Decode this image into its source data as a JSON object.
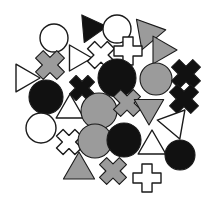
{
  "canvas": {
    "width": 207,
    "height": 199,
    "background": "#ffffff",
    "title": "shape-cluster-image"
  },
  "palette": {
    "black": "#111111",
    "gray": "#9b9b9b",
    "white": "#ffffff",
    "outline": "#1a1a1a",
    "background": "#ffffff"
  },
  "counts": {
    "total": 33,
    "circles": 11,
    "triangles": 11,
    "crosses": 11,
    "black": 11,
    "gray": 11,
    "white": 11
  },
  "shapes": [
    {
      "id": 1,
      "kind": "circle",
      "fill": "white",
      "cx": 54,
      "cy": 38,
      "r": 14,
      "rotation": 0,
      "label": "white-circle-top-left"
    },
    {
      "id": 2,
      "kind": "triangle",
      "fill": "black",
      "cx": 91,
      "cy": 28,
      "r": 16,
      "rotation": 205,
      "label": "black-triangle-top"
    },
    {
      "id": 3,
      "kind": "circle",
      "fill": "white",
      "cx": 117,
      "cy": 29,
      "r": 14,
      "rotation": 0,
      "label": "white-circle-top-center"
    },
    {
      "id": 4,
      "kind": "triangle",
      "fill": "gray",
      "cx": 148,
      "cy": 33,
      "r": 18,
      "rotation": 200,
      "label": "gray-triangle-top-right"
    },
    {
      "id": 5,
      "kind": "triangle",
      "fill": "gray",
      "cx": 161,
      "cy": 50,
      "r": 16,
      "rotation": 90,
      "label": "gray-triangle-upper-right"
    },
    {
      "id": 6,
      "kind": "cross-x",
      "fill": "gray",
      "cx": 50,
      "cy": 65,
      "r": 15,
      "rotation": 45,
      "label": "gray-x-left"
    },
    {
      "id": 7,
      "kind": "triangle",
      "fill": "white",
      "cx": 77,
      "cy": 58,
      "r": 15,
      "rotation": 90,
      "label": "white-triangle-upper-center"
    },
    {
      "id": 8,
      "kind": "cross-x",
      "fill": "white",
      "cx": 101,
      "cy": 55,
      "r": 14,
      "rotation": 45,
      "label": "white-x-top-center"
    },
    {
      "id": 9,
      "kind": "cross-x",
      "fill": "white",
      "cx": 128,
      "cy": 51,
      "r": 14,
      "rotation": 0,
      "label": "white-plus-top-center"
    },
    {
      "id": 10,
      "kind": "triangle",
      "fill": "white",
      "cx": 24,
      "cy": 78,
      "r": 16,
      "rotation": 90,
      "label": "white-triangle-left-edge"
    },
    {
      "id": 11,
      "kind": "circle",
      "fill": "black",
      "cx": 117,
      "cy": 78,
      "r": 19,
      "rotation": 0,
      "label": "black-circle-center-top"
    },
    {
      "id": 12,
      "kind": "circle",
      "fill": "gray",
      "cx": 156,
      "cy": 79,
      "r": 16,
      "rotation": 0,
      "label": "gray-circle-right"
    },
    {
      "id": 13,
      "kind": "cross-x",
      "fill": "black",
      "cx": 186,
      "cy": 74,
      "r": 15,
      "rotation": 45,
      "label": "black-x-right-upper"
    },
    {
      "id": 14,
      "kind": "cross-x",
      "fill": "black",
      "cx": 82,
      "cy": 88,
      "r": 13,
      "rotation": 45,
      "label": "black-x-center-left"
    },
    {
      "id": 15,
      "kind": "circle",
      "fill": "black",
      "cx": 46,
      "cy": 97,
      "r": 17,
      "rotation": 0,
      "label": "black-circle-left"
    },
    {
      "id": 16,
      "kind": "cross-x",
      "fill": "black",
      "cx": 184,
      "cy": 99,
      "r": 15,
      "rotation": 45,
      "label": "black-x-right-lower"
    },
    {
      "id": 17,
      "kind": "triangle",
      "fill": "white",
      "cx": 70,
      "cy": 110,
      "r": 16,
      "rotation": 0,
      "label": "white-triangle-center"
    },
    {
      "id": 18,
      "kind": "circle",
      "fill": "gray",
      "cx": 99,
      "cy": 111,
      "r": 18,
      "rotation": 0,
      "label": "gray-circle-center"
    },
    {
      "id": 19,
      "kind": "cross-x",
      "fill": "gray",
      "cx": 127,
      "cy": 103,
      "r": 14,
      "rotation": 45,
      "label": "gray-x-center-right"
    },
    {
      "id": 20,
      "kind": "triangle",
      "fill": "gray",
      "cx": 149,
      "cy": 108,
      "r": 17,
      "rotation": 180,
      "label": "gray-triangle-center-right"
    },
    {
      "id": 21,
      "kind": "circle",
      "fill": "white",
      "cx": 41,
      "cy": 128,
      "r": 15,
      "rotation": 0,
      "label": "white-circle-lower-left"
    },
    {
      "id": 22,
      "kind": "triangle",
      "fill": "white",
      "cx": 174,
      "cy": 123,
      "r": 17,
      "rotation": 160,
      "label": "white-triangle-right-lower"
    },
    {
      "id": 23,
      "kind": "cross-x",
      "fill": "white",
      "cx": 69,
      "cy": 142,
      "r": 13,
      "rotation": 45,
      "label": "white-x-lower-left"
    },
    {
      "id": 24,
      "kind": "circle",
      "fill": "gray",
      "cx": 95,
      "cy": 141,
      "r": 17,
      "rotation": 0,
      "label": "gray-circle-lower-center"
    },
    {
      "id": 25,
      "kind": "circle",
      "fill": "black",
      "cx": 124,
      "cy": 140,
      "r": 17,
      "rotation": 0,
      "label": "black-circle-lower-center"
    },
    {
      "id": 26,
      "kind": "triangle",
      "fill": "white",
      "cx": 152,
      "cy": 146,
      "r": 16,
      "rotation": 0,
      "label": "white-triangle-lower-right"
    },
    {
      "id": 27,
      "kind": "circle",
      "fill": "black",
      "cx": 180,
      "cy": 155,
      "r": 15,
      "rotation": 0,
      "label": "black-circle-bottom-right"
    },
    {
      "id": 28,
      "kind": "triangle",
      "fill": "gray",
      "cx": 79,
      "cy": 170,
      "r": 18,
      "rotation": 0,
      "label": "gray-triangle-bottom"
    },
    {
      "id": 29,
      "kind": "cross-x",
      "fill": "gray",
      "cx": 113,
      "cy": 171,
      "r": 14,
      "rotation": 45,
      "label": "gray-x-bottom"
    },
    {
      "id": 30,
      "kind": "cross-x",
      "fill": "white",
      "cx": 147,
      "cy": 178,
      "r": 14,
      "rotation": 0,
      "label": "white-plus-bottom"
    },
    {
      "id": 31,
      "kind": "circle",
      "fill": "white",
      "cx": 54,
      "cy": 38,
      "r": 0,
      "rotation": 0,
      "label": "hidden-spacer-a"
    },
    {
      "id": 32,
      "kind": "circle",
      "fill": "white",
      "cx": 54,
      "cy": 38,
      "r": 0,
      "rotation": 0,
      "label": "hidden-spacer-b"
    },
    {
      "id": 33,
      "kind": "circle",
      "fill": "white",
      "cx": 54,
      "cy": 38,
      "r": 0,
      "rotation": 0,
      "label": "hidden-spacer-c"
    }
  ]
}
